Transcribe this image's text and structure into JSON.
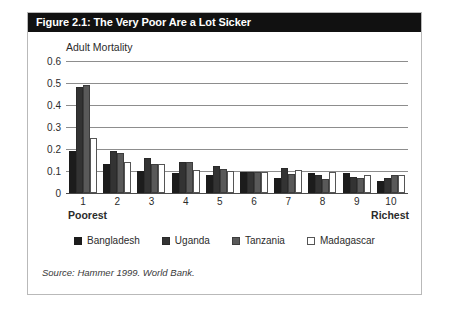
{
  "figure": {
    "title": "Figure 2.1: The Very Poor Are a Lot Sicker",
    "source_note": "Source: Hammer 1999. World Bank.",
    "poorest_label": "Poorest",
    "richest_label": "Richest",
    "title_bar_color": "#111111",
    "title_text_color": "#ffffff",
    "frame_color": "#b9b9b9"
  },
  "chart_data": {
    "type": "bar",
    "title": "Adult Mortality",
    "xlabel": "",
    "ylabel": "Adult Mortality",
    "categories": [
      "1",
      "2",
      "3",
      "4",
      "5",
      "6",
      "7",
      "8",
      "9",
      "10"
    ],
    "yticks": [
      "0",
      "0.1",
      "0.2",
      "0.3",
      "0.4",
      "0.5",
      "0.6"
    ],
    "ytick_values": [
      0,
      0.1,
      0.2,
      0.3,
      0.4,
      0.5,
      0.6
    ],
    "ylim": [
      0,
      0.6
    ],
    "grid": true,
    "legend_position": "bottom",
    "series": [
      {
        "name": "Bangladesh",
        "color": "#1c1c1c",
        "values": [
          0.19,
          0.13,
          0.1,
          0.09,
          0.08,
          0.095,
          0.07,
          0.09,
          0.09,
          0.055
        ]
      },
      {
        "name": "Uganda",
        "color": "#333333",
        "values": [
          0.48,
          0.19,
          0.16,
          0.14,
          0.125,
          0.095,
          0.115,
          0.08,
          0.075,
          0.07
        ]
      },
      {
        "name": "Tanzania",
        "color": "#595959",
        "values": [
          0.49,
          0.18,
          0.13,
          0.14,
          0.11,
          0.095,
          0.085,
          0.065,
          0.07,
          0.08
        ]
      },
      {
        "name": "Madagascar",
        "color": "#ffffff",
        "values": [
          0.25,
          0.14,
          0.13,
          0.105,
          0.1,
          0.095,
          0.105,
          0.095,
          0.08,
          0.08
        ]
      }
    ]
  }
}
